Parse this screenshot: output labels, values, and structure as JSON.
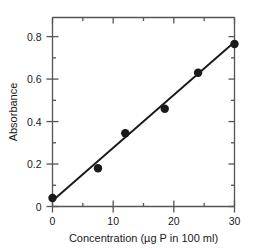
{
  "chart_data": {
    "type": "scatter",
    "title": "",
    "subtitle": "",
    "xlabel": "Concentration (µg P in 100 ml)",
    "ylabel": "Absorbance",
    "xlim": [
      0,
      30
    ],
    "ylim": [
      0,
      0.89
    ],
    "grid": false,
    "legend": null,
    "frame": "box",
    "tick_direction": "in",
    "x_ticks_major": [
      0,
      10,
      20,
      30
    ],
    "x_tick_labels": [
      "0",
      "10",
      "20",
      "30"
    ],
    "x_ticks_minor": [
      5,
      15,
      25
    ],
    "y_ticks_major": [
      0,
      0.2,
      0.4,
      0.6,
      0.8
    ],
    "y_tick_labels": [
      "0",
      "0.2",
      "0.4",
      "0.6",
      "0.8"
    ],
    "y_ticks_minor": [
      0.1,
      0.3,
      0.5,
      0.7
    ],
    "marker": "filled-circle",
    "marker_color": "#1a1a1a",
    "line_color": "#1a1a1a",
    "points": [
      {
        "x": 0.0,
        "y": 0.04
      },
      {
        "x": 7.5,
        "y": 0.18
      },
      {
        "x": 12.0,
        "y": 0.345
      },
      {
        "x": 18.5,
        "y": 0.46
      },
      {
        "x": 24.0,
        "y": 0.63
      },
      {
        "x": 30.0,
        "y": 0.765
      }
    ],
    "fit_line": {
      "type": "linear-regression",
      "x_start": 0.0,
      "y_start": 0.027,
      "x_end": 30.0,
      "y_end": 0.775
    }
  },
  "colors": {
    "ink": "#1a1a1a",
    "frame": "#555555",
    "background": "#ffffff"
  }
}
